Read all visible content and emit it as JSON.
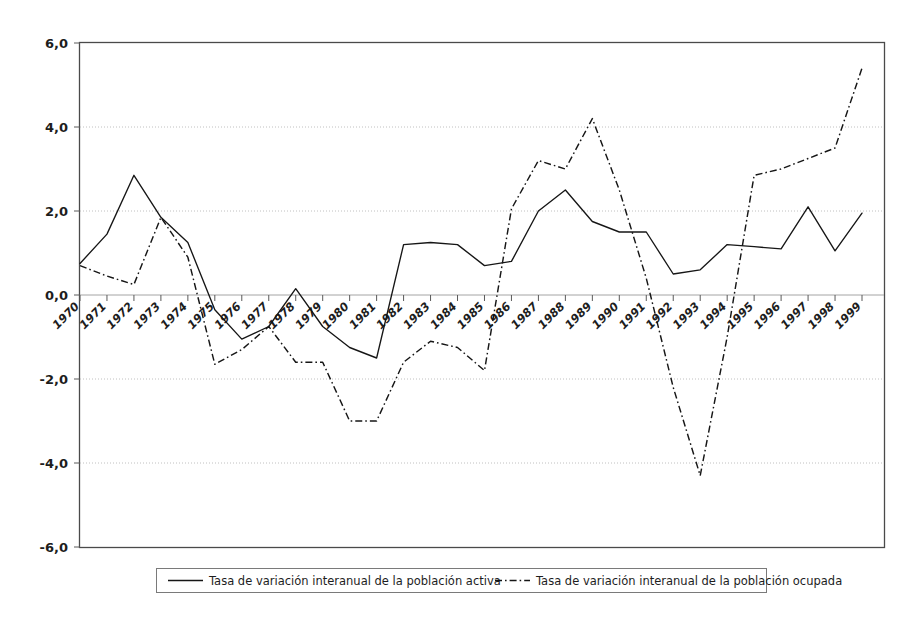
{
  "chart_data": {
    "type": "line",
    "title": "",
    "subtitle": "",
    "xlabel": "",
    "ylabel": "",
    "grid": true,
    "legend_position": "bottom",
    "xlim": [
      1970,
      1999
    ],
    "ylim": [
      -6.0,
      6.0
    ],
    "ytick_labels": [
      "6,0",
      "4,0",
      "2,0",
      "0,0",
      "-2,0",
      "-4,0",
      "-6,0"
    ],
    "ytick_values": [
      6.0,
      4.0,
      2.0,
      0.0,
      -2.0,
      -4.0,
      -6.0
    ],
    "categories": [
      "1970",
      "1971",
      "1972",
      "1973",
      "1974",
      "1975",
      "1976",
      "1977",
      "1978",
      "1979",
      "1980",
      "1981",
      "1982",
      "1983",
      "1984",
      "1985",
      "1986",
      "1987",
      "1988",
      "1989",
      "1990",
      "1991",
      "1992",
      "1993",
      "1994",
      "1995",
      "1996",
      "1997",
      "1998",
      "1999"
    ],
    "series": [
      {
        "name": "Tasa de variación interanual de la población activa",
        "style": "solid",
        "values": [
          0.75,
          1.45,
          2.85,
          1.85,
          1.25,
          -0.35,
          -1.05,
          -0.75,
          0.15,
          -0.75,
          -1.25,
          -1.5,
          1.2,
          1.25,
          1.2,
          0.7,
          0.8,
          2.0,
          2.5,
          1.75,
          1.5,
          1.5,
          0.5,
          0.6,
          1.2,
          1.15,
          1.1,
          2.1,
          1.05,
          1.95
        ]
      },
      {
        "name": "Tasa de variación interanual de la población ocupada",
        "style": "dash-dot",
        "values": [
          0.7,
          0.45,
          0.25,
          1.85,
          0.9,
          -1.65,
          -1.3,
          -0.75,
          -1.6,
          -1.6,
          -3.0,
          -3.0,
          -1.6,
          -1.1,
          -1.25,
          -1.8,
          2.05,
          3.2,
          3.0,
          4.2,
          2.5,
          0.4,
          -2.2,
          -4.3,
          -1.0,
          2.85,
          3.0,
          3.25,
          3.5,
          5.4
        ]
      }
    ]
  },
  "legend": {
    "items": [
      {
        "label": "Tasa de variación interanual de la población activa",
        "style": "solid"
      },
      {
        "label": "Tasa de variación interanual de la población ocupada",
        "style": "dash-dot"
      }
    ]
  },
  "colors": {
    "line": "#161616",
    "grid": "#b9b9b9",
    "frame": "#4a4a4a",
    "background": "#ffffff"
  }
}
